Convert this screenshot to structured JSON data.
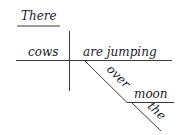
{
  "diagram": {
    "type": "sentence-diagram",
    "expletive": "There",
    "subject": "cows",
    "verb": "are jumping",
    "preposition": "over",
    "object": "moon",
    "article": "the"
  }
}
